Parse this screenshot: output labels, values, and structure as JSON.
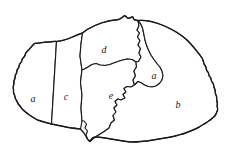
{
  "figure": {
    "type": "region-partition-map",
    "background_color": "#ffffff",
    "ink_color": "#1a1a1a",
    "canvas": {
      "width": 228,
      "height": 163
    }
  },
  "regions": [
    {
      "id": "region-a-left",
      "label": "a",
      "label_x": 33,
      "label_y": 99,
      "position_hint": "far-left",
      "outline": "M 34.5 43.5 C 31 46.5 29.5 49.5 27 51.5 C 24.5 53.5 25.8 56 23.5 57.5 C 21.2 59 22.5 61.5 20.5 63 C 18.5 64.5 19.8 67 18 68.5 C 16.2 70 17.5 72.5 16 74 C 14.5 75.5 15.8 78 14.5 79.5 C 13.2 81 14.5 83.5 13.5 85.5 C 12.5 87.5 14 89.5 13.5 91.5 C 13 93.5 15 95 15 97 C 15 99 17 100.5 17.5 102.5 C 18 104.5 20 105.5 21 107.5 C 22 109.5 24 110.5 25.5 112 C 27 113.5 29 114.5 31 116 C 33 117.5 35 118.5 37.5 120 L 51.5 124 L 56.5 41.5 C 54 41 51 41.8 48.5 42 C 46 42.2 43 42.5 40.5 42.8 C 38 43.1 36.5 43.2 34.5 43.5 Z"
    },
    {
      "id": "region-c",
      "label": "c",
      "label_x": 66,
      "label_y": 97,
      "position_hint": "left-center",
      "outline": "M 56.5 41.5 L 51.5 124 C 56 125 61 126 66 127 C 71 128 76 128.5 80.5 129 L 82 121 L 81 108 L 82 95 L 80.5 82 L 82 70 L 80 56 L 81 44 L 82.5 33 C 79 34 75.5 35.5 72.5 37 C 69.5 38.5 66.5 39.5 63.5 40.2 C 60.5 40.9 58.5 41.2 56.5 41.5 Z"
    },
    {
      "id": "region-d",
      "label": "d",
      "label_x": 104,
      "label_y": 50,
      "position_hint": "top-center",
      "outline": "M 82.5 33 C 86 30 90.5 27.5 95 25.5 C 99.5 23.5 104 22 108.5 21 C 113 20 116 20 118.5 19.5 C 121 19 122.5 17 124 16 C 125.5 15 126 17 127.5 18 C 129 19 130.5 17.5 132 17 C 133.5 16.5 133 18.5 134 19.5 C 135 20.5 136.5 20 138 20.5 L 139 26 L 137 30 L 139.5 33 L 137.5 37 L 140 40.5 L 138 45 L 140.5 48.5 L 139 53 L 141 57 L 138.5 61.5 L 136 62 L 132 59.5 L 127 59 L 121 60.5 L 115 62.5 L 110 64.5 L 105 65.5 L 100 65 L 96 63.5 L 92 64.5 L 88 67 L 84.5 69 L 82 70 L 80 56 L 81 44 L 82.5 33 Z"
    },
    {
      "id": "region-e",
      "label": "e",
      "label_x": 111,
      "label_y": 96,
      "position_hint": "center",
      "outline": "M 82 70 L 84.5 69 L 88 67 L 92 64.5 L 96 63.5 L 100 65 L 105 65.5 L 110 64.5 L 115 62.5 L 121 60.5 L 127 59 L 132 59.5 L 136 62 L 136.5 67 L 134 71 L 135.5 76 L 133 80 L 134.5 85 L 131 87 L 127 86.5 L 124 88.5 L 126 92 L 123 94.5 L 125 98 L 121 100 L 118 99 L 115 101.5 L 117 105 L 114 108 L 116 112 L 113 115.5 L 114.5 120 L 111 123 L 109 128 L 105 131 L 101 133.5 L 97 136 L 93 138.5 L 90 141.5 L 87.5 139 L 86 135 L 87.5 131 L 85 128 L 86.5 124 L 84 121 L 82 121 L 81 108 L 82 95 L 80.5 82 L 82 70 Z"
    },
    {
      "id": "region-a-inner",
      "label": "a",
      "label_x": 154,
      "label_y": 76,
      "position_hint": "center-right-wedge",
      "outline": "M 138 20.5 C 139.5 22 141 24 142 26.5 C 143 29 143.5 32 144 35 L 145 40 L 146.5 45 L 148.5 50 L 151 55 L 154 59.5 L 157 63.5 L 160 67 L 162 71 L 163 75.5 L 162 80 L 159.5 83.5 L 156 86 L 152 87 L 148 86.5 L 144.5 85 L 141.5 83 L 138 81.5 L 134.5 85 L 133 80 L 135.5 76 L 134 71 L 136.5 67 L 136 62 L 138.5 61.5 L 141 57 L 139 53 L 140.5 48.5 L 138 45 L 140 40.5 L 137.5 37 L 139.5 33 L 137 30 L 139 26 L 138 20.5 Z"
    },
    {
      "id": "region-b",
      "label": "b",
      "label_x": 178,
      "label_y": 105,
      "position_hint": "right",
      "outline": "M 138 20.5 C 142 20 146.5 20.5 151 21.5 C 155.5 22.5 160 24 164.5 26 C 169 28 173 30 177 32.5 C 181 35 184.5 37.5 187.5 40.5 C 190.5 43.5 193 46.5 195.5 49.5 C 198 52.5 200 55 202 58 C 204 61 203 63.5 205 65.5 C 207 67.5 205.5 70 207.5 71.5 C 209.5 73 208 75.5 210 77 C 212 78.5 210.5 81 212.5 82.5 C 214.5 84 213 86.5 214.5 88.5 C 216 90.5 214.5 93 216 95 C 217.5 97 216 99.5 217 101.5 C 218 103.5 216.5 106 217.5 108 C 218.5 110 216.5 112 216 114 C 215.5 116 213.5 117 212 118.5 C 210.5 120 208.5 121 206.5 122.5 C 204.5 124 202 125 200 126.5 C 198 128 195.5 129 193 130 C 190.5 131 188 132 185.5 133 C 183 134 180 134.5 177 135.5 C 174 136.5 171 137 168 137.5 C 165 138 162 138.5 159 139 C 156 139.5 153 140 150 140.5 C 147 141 144 141.2 141 141.5 C 138 141.8 135 142 132 142 C 129 142 126 141.5 123 141 C 120 140.5 117 140 114 139.5 C 111 139 108 138.5 105 138 C 102 137.5 99 137 96 137 C 93.5 137 91.5 138 90 141.5 L 93 138.5 L 97 136 L 101 133.5 L 105 131 L 109 128 L 111 123 L 114.5 120 L 113 115.5 L 116 112 L 114 108 L 117 105 L 115 101.5 L 118 99 L 121 100 L 125 98 L 123 94.5 L 126 92 L 124 88.5 L 127 86.5 L 131 87 L 134.5 85 L 138 81.5 L 141.5 83 L 144.5 85 L 148 86.5 L 152 87 L 156 86 L 159.5 83.5 L 162 80 L 163 75.5 L 162 71 L 160 67 L 157 63.5 L 154 59.5 L 151 55 L 148.5 50 L 146.5 45 L 145 40 L 144 35 C 143.5 32 143 29 142 26.5 C 141 24 139.5 22 138 20.5 Z"
    }
  ],
  "outer_outline": {
    "id": "outer-boundary",
    "path": "M 34.5 43.5 C 31 46.5 29.5 49.5 27 51.5 C 24.5 53.5 25.8 56 23.5 57.5 C 21.2 59 22.5 61.5 20.5 63 C 18.5 64.5 19.8 67 18 68.5 C 16.2 70 17.5 72.5 16 74 C 14.5 75.5 15.8 78 14.5 79.5 C 13.2 81 14.5 83.5 13.5 85.5 C 12.5 87.5 14 89.5 13.5 91.5 C 13 93.5 15 95 15 97 C 15 99 17 100.5 17.5 102.5 C 18 104.5 20 105.5 21 107.5 C 22 109.5 24 110.5 25.5 112 C 27 113.5 29 114.5 31 116 C 33 117.5 35 118.5 37.5 120 C 42 121.5 47 123 51.5 124 C 56 125 61 126 66 127 C 71 128 76 128.5 80.5 129 C 83 131.5 85.5 134.5 87.5 139 C 88.5 141 89 141.5 90 141.5 C 91.5 138 93.5 137 96 137 C 99 137 102 137.5 105 138 C 108 138.5 111 139 114 139.5 C 117 140 120 140.5 123 141 C 126 141.5 129 142 132 142 C 135 142 138 141.8 141 141.5 C 144 141.2 147 141 150 140.5 C 153 140 156 139.5 159 139 C 162 138.5 165 138 168 137.5 C 171 137 174 136.5 177 135.5 C 180 134.5 183 134 185.5 133 C 188 132 190.5 131 193 130 C 195.5 129 198 128 200 126.5 C 202 125 204.5 124 206.5 122.5 C 208.5 121 210.5 120 212 118.5 C 213.5 117 215.5 116 216 114 C 216.5 112 218.5 110 217.5 108 C 216.5 106 218 103.5 217 101.5 C 216 99.5 217.5 97 216 95 C 214.5 93 216 90.5 214.5 88.5 C 213 86.5 214.5 84 212.5 82.5 C 210.5 81 212 78.5 210 77 C 208 75.5 209.5 73 207.5 71.5 C 205.5 70 207 67.5 205 65.5 C 203 63.5 204 61 202 58 C 200 55 198 52.5 195.5 49.5 C 193 46.5 190.5 43.5 187.5 40.5 C 184.5 37.5 181 35 177 32.5 C 173 30 169 28 164.5 26 C 160 24 155.5 22.5 151 21.5 C 146.5 20.5 142 20 138 20.5 C 136.5 20 135 20.5 134 19.5 C 133 18.5 133.5 16.5 132 17 C 130.5 17.5 129 19 127.5 18 C 126 17 125.5 15 124 16 C 122.5 17 121 19 118.5 19.5 C 116 20 113 20 108.5 21 C 104 22 99.5 23.5 95 25.5 C 90.5 27.5 86 30 82.5 33 C 79 34 75.5 35.5 72.5 37 C 69.5 38.5 66.5 39.5 63.5 40.2 C 60.5 40.9 58.5 41.2 56.5 41.5 C 54 41 51 41.8 48.5 42 C 46 42.2 43 42.5 40.5 42.8 C 38 43.1 36.5 43.2 34.5 43.5 Z"
  }
}
